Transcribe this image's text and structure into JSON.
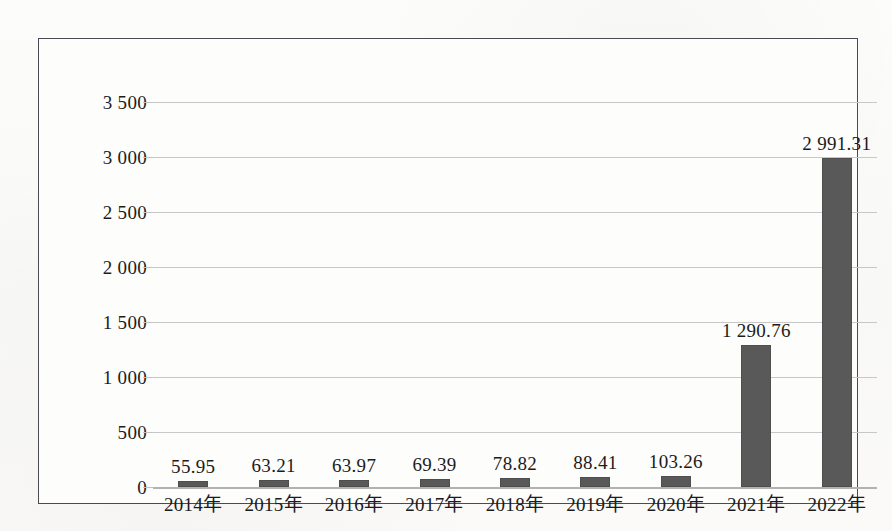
{
  "chart_data": {
    "type": "bar",
    "title": "",
    "subtitle": "",
    "xlabel": "",
    "ylabel": "",
    "categories": [
      "2014年",
      "2015年",
      "2016年",
      "2017年",
      "2018年",
      "2019年",
      "2020年",
      "2021年",
      "2022年"
    ],
    "values": [
      55.95,
      63.21,
      63.97,
      69.39,
      78.82,
      88.41,
      103.26,
      1290.76,
      2991.31
    ],
    "data_labels": [
      "55.95",
      "63.21",
      "63.97",
      "69.39",
      "78.82",
      "88.41",
      "103.26",
      "1 290.76",
      "2 991.31"
    ],
    "series": [
      {
        "name": "",
        "values": [
          55.95,
          63.21,
          63.97,
          69.39,
          78.82,
          88.41,
          103.26,
          1290.76,
          2991.31
        ],
        "color": "#595959"
      }
    ],
    "ylim": [
      0,
      3500
    ],
    "ytick_values": [
      0,
      500,
      1000,
      1500,
      2000,
      2500,
      3000,
      3500
    ],
    "ytick_labels": [
      "0",
      "500",
      "1 000",
      "1 500",
      "2 000",
      "2 500",
      "3 000",
      "3 500"
    ],
    "grid": true,
    "grid_axis": "y",
    "legend": false,
    "legend_position": "none",
    "bar_color": "#595959",
    "gridline_color": "#c8c8c8",
    "axis_color": "#b2b2b2",
    "frame_color": "#4a4a52",
    "background_color": "#fdfdfc",
    "thousands_separator": " "
  }
}
